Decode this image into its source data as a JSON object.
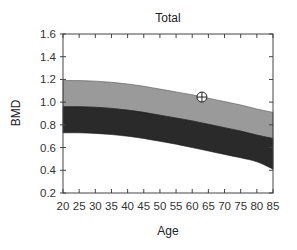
{
  "chart_data": {
    "type": "area",
    "title": "Total",
    "xlabel": "Age",
    "ylabel": "BMD",
    "xlim": [
      20,
      85
    ],
    "ylim": [
      0.2,
      1.6
    ],
    "x_ticks": [
      20,
      25,
      30,
      35,
      40,
      45,
      50,
      55,
      60,
      65,
      70,
      75,
      80,
      85
    ],
    "y_ticks": [
      0.2,
      0.4,
      0.6,
      0.8,
      1.0,
      1.2,
      1.4,
      1.6
    ],
    "y_tick_labels": [
      "0.2",
      "0.4",
      "0.6",
      "0.8",
      "1.0",
      "1.2",
      "1.4",
      "1.6"
    ],
    "grid": false,
    "x": [
      20,
      25,
      30,
      35,
      40,
      45,
      50,
      55,
      60,
      65,
      70,
      75,
      80,
      85
    ],
    "series": [
      {
        "name": "upper band (light gray)",
        "color": "#9a9a9a",
        "upper": [
          1.19,
          1.19,
          1.185,
          1.175,
          1.16,
          1.14,
          1.115,
          1.09,
          1.065,
          1.035,
          1.005,
          0.975,
          0.94,
          0.91
        ],
        "lower": [
          0.96,
          0.96,
          0.955,
          0.945,
          0.93,
          0.91,
          0.885,
          0.86,
          0.835,
          0.805,
          0.775,
          0.745,
          0.71,
          0.68
        ]
      },
      {
        "name": "lower band (dark gray)",
        "color": "#2a2a2a",
        "upper": [
          0.96,
          0.96,
          0.955,
          0.945,
          0.93,
          0.91,
          0.885,
          0.86,
          0.835,
          0.805,
          0.775,
          0.745,
          0.71,
          0.68
        ],
        "lower": [
          0.73,
          0.73,
          0.725,
          0.715,
          0.7,
          0.68,
          0.655,
          0.63,
          0.6,
          0.57,
          0.54,
          0.51,
          0.475,
          0.41
        ]
      }
    ],
    "marker": {
      "x": 63,
      "y": 1.045,
      "symbol": "circle-crosshair"
    }
  }
}
